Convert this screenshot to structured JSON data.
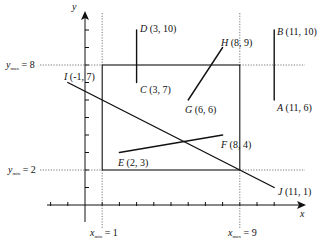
{
  "diagram": {
    "axes": {
      "x_label": "x",
      "y_label": "y"
    },
    "window": {
      "xmin": 1,
      "xmax": 9,
      "ymin": 2,
      "ymax": 8,
      "labels": {
        "ymax_var": "y",
        "ymax_sub": "max",
        "ymax_val": " = 8",
        "ymin_var": "y",
        "ymin_sub": "min",
        "ymin_val": " = 2",
        "xmin_var": "x",
        "xmin_sub": "min",
        "xmin_val": " = 1",
        "xmax_var": "x",
        "xmax_sub": "max",
        "xmax_val": " = 9"
      }
    },
    "points": {
      "A": {
        "name": "A",
        "coords": " (11, 6)",
        "x": 11,
        "y": 6
      },
      "B": {
        "name": "B",
        "coords": " (11, 10)",
        "x": 11,
        "y": 10
      },
      "C": {
        "name": "C",
        "coords": " (3, 7)",
        "x": 3,
        "y": 7
      },
      "D": {
        "name": "D",
        "coords": " (3, 10)",
        "x": 3,
        "y": 10
      },
      "E": {
        "name": "E",
        "coords": " (2, 3)",
        "x": 2,
        "y": 3
      },
      "F": {
        "name": "F",
        "coords": " (8, 4)",
        "x": 8,
        "y": 4
      },
      "G": {
        "name": "G",
        "coords": " (6, 6)",
        "x": 6,
        "y": 6
      },
      "H": {
        "name": "H",
        "coords": " (8, 9)",
        "x": 8,
        "y": 9
      },
      "I": {
        "name": "I",
        "coords": " (-1, 7)",
        "x": -1,
        "y": 7
      },
      "J": {
        "name": "J",
        "coords": " (11, 1)",
        "x": 11,
        "y": 1
      }
    },
    "segments": [
      {
        "from": "A",
        "to": "B"
      },
      {
        "from": "C",
        "to": "D"
      },
      {
        "from": "E",
        "to": "F"
      },
      {
        "from": "G",
        "to": "H"
      },
      {
        "from": "I",
        "to": "J"
      }
    ],
    "colors": {
      "line": "#111111",
      "dotted": "#555555"
    }
  }
}
